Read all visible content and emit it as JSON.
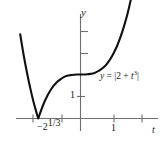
{
  "chart_data": {
    "type": "line",
    "title": "",
    "xlabel": "t",
    "ylabel": "y",
    "grid": false,
    "legend": null,
    "annotations": [
      {
        "id": "curve-equation",
        "text_plain": "y = |2 + t^3|",
        "parts": {
          "lhs": "y",
          "equals": " = ",
          "bar_open": "|",
          "term1": "2 + ",
          "base": "t",
          "exponent": "3",
          "bar_close": "|"
        },
        "x": 0.45,
        "y": 1.95
      }
    ],
    "axes": {
      "x_axis": {
        "label": "t",
        "range": [
          -1.85,
          1.65
        ],
        "tick_positions": [
          -1,
          -1.26,
          1
        ],
        "tick_labels": [
          "",
          "−2^(1/3)",
          "1"
        ],
        "visible_labels": [
          {
            "text_plain": "−2^1/3",
            "minus": "−",
            "base": "2",
            "exponent": "1/3",
            "at": -1.26
          },
          {
            "text_plain": "1",
            "at": 1
          }
        ]
      },
      "y_axis": {
        "label": "y",
        "range": [
          -0.55,
          5.9
        ],
        "tick_positions": [
          1,
          3,
          4
        ],
        "visible_labels": [
          {
            "text_plain": "1",
            "at": 1
          }
        ]
      }
    },
    "function": {
      "expression": "abs(2 + t^3)",
      "cusp_at_t": -1.2599,
      "cusp_value": 0,
      "y_intercept": 2,
      "description": "Absolute value of 2 plus t cubed; V-shaped cusp touching the t-axis at t = -2^(1/3), flattening near y = 2 around t = 0, rising steeply on both ends."
    },
    "data_points": [
      {
        "t": -1.8,
        "y": 3.83
      },
      {
        "t": -1.7,
        "y": 2.91
      },
      {
        "t": -1.6,
        "y": 2.1
      },
      {
        "t": -1.5,
        "y": 1.38
      },
      {
        "t": -1.4,
        "y": 0.74
      },
      {
        "t": -1.3,
        "y": 0.2
      },
      {
        "t": -1.2599,
        "y": 0.0
      },
      {
        "t": -1.2,
        "y": 0.27
      },
      {
        "t": -1.1,
        "y": 0.67
      },
      {
        "t": -1.0,
        "y": 1.0
      },
      {
        "t": -0.9,
        "y": 1.27
      },
      {
        "t": -0.8,
        "y": 1.49
      },
      {
        "t": -0.7,
        "y": 1.66
      },
      {
        "t": -0.6,
        "y": 1.78
      },
      {
        "t": -0.5,
        "y": 1.88
      },
      {
        "t": -0.4,
        "y": 1.94
      },
      {
        "t": -0.3,
        "y": 1.97
      },
      {
        "t": -0.2,
        "y": 1.99
      },
      {
        "t": -0.1,
        "y": 2.0
      },
      {
        "t": 0.0,
        "y": 2.0
      },
      {
        "t": 0.1,
        "y": 2.0
      },
      {
        "t": 0.2,
        "y": 2.01
      },
      {
        "t": 0.3,
        "y": 2.03
      },
      {
        "t": 0.4,
        "y": 2.06
      },
      {
        "t": 0.5,
        "y": 2.13
      },
      {
        "t": 0.6,
        "y": 2.22
      },
      {
        "t": 0.7,
        "y": 2.34
      },
      {
        "t": 0.8,
        "y": 2.51
      },
      {
        "t": 0.9,
        "y": 2.73
      },
      {
        "t": 1.0,
        "y": 3.0
      },
      {
        "t": 1.1,
        "y": 3.33
      },
      {
        "t": 1.2,
        "y": 3.73
      },
      {
        "t": 1.3,
        "y": 4.2
      },
      {
        "t": 1.4,
        "y": 4.74
      },
      {
        "t": 1.5,
        "y": 5.38
      },
      {
        "t": 1.58,
        "y": 5.94
      }
    ],
    "style": {
      "curve_color": "#111111",
      "curve_width": 2.1,
      "axis_color": "#6f6f6f",
      "axis_width": 1.1,
      "background": "#ffffff",
      "text_color": "#1a1a1a"
    }
  }
}
